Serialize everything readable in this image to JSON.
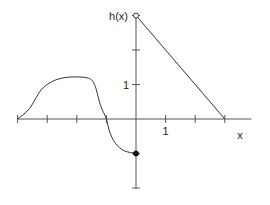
{
  "chart_data": {
    "type": "line",
    "title": "",
    "xlabel": "x",
    "ylabel": "h(x)",
    "xlim": [
      -4,
      3.9
    ],
    "ylim": [
      -2,
      3
    ],
    "x_ticks": [
      -4,
      -3,
      -2,
      -1,
      1,
      2,
      3
    ],
    "y_ticks": [
      -2,
      -1,
      1,
      2,
      3
    ],
    "x_tick_labels": [
      {
        "value": 1,
        "label": "1"
      }
    ],
    "y_tick_labels": [
      {
        "value": 1,
        "label": "1"
      }
    ],
    "series": [
      {
        "name": "h-left-curve",
        "points": [
          [
            -4,
            0
          ],
          [
            -3.6,
            0.3
          ],
          [
            -3.2,
            0.85
          ],
          [
            -2.8,
            1.1
          ],
          [
            -2.4,
            1.2
          ],
          [
            -2,
            1.22
          ],
          [
            -1.6,
            1.18
          ],
          [
            -1.4,
            1.0
          ],
          [
            -1.2,
            0.4
          ],
          [
            -1,
            0
          ],
          [
            -0.9,
            -0.35
          ],
          [
            -0.7,
            -0.7
          ],
          [
            -0.4,
            -0.92
          ],
          [
            0,
            -1
          ]
        ],
        "end_marker": {
          "x": 0,
          "y": -1,
          "type": "closed"
        }
      },
      {
        "name": "h-right-line",
        "points": [
          [
            0,
            3
          ],
          [
            3,
            0
          ]
        ],
        "start_marker": {
          "x": 0,
          "y": 3,
          "type": "open"
        }
      }
    ],
    "grid": false,
    "legend": "none"
  }
}
